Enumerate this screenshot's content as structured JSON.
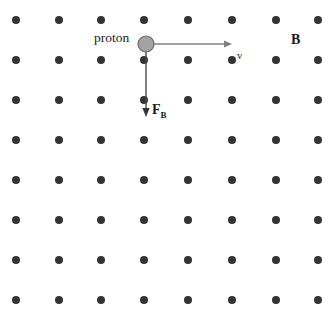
{
  "figure": {
    "width": 334,
    "height": 315,
    "background_color": "#ffffff"
  },
  "field": {
    "name": "magnetic-field-dot-grid",
    "symbol_meaning": "field-out-of-page",
    "dot_color": "#333333",
    "dot_radius": 4,
    "columns_x": [
      16,
      59,
      101,
      144,
      188,
      232,
      276,
      318
    ],
    "rows_y": [
      20,
      60,
      100,
      140,
      180,
      220,
      260,
      300
    ],
    "column_count": 8,
    "row_count": 8
  },
  "proton": {
    "label": "proton",
    "center_x": 146,
    "center_y": 44,
    "radius": 8,
    "fill_color": "#a3a3a3",
    "stroke_color": "#6b6b6b"
  },
  "velocity_vector": {
    "label": "v",
    "color": "#808080",
    "start_x": 154,
    "start_y": 44,
    "end_x": 232,
    "end_y": 44,
    "direction": "right",
    "label_x": 237,
    "label_y": 51
  },
  "force_vector": {
    "label": "F",
    "subscript": "B",
    "color": "#333333",
    "start_x": 146,
    "start_y": 50,
    "end_x": 146,
    "end_y": 117,
    "direction": "down",
    "label_x": 152,
    "label_y": 103
  },
  "field_label": {
    "label": "B",
    "color": "#1a1a1a",
    "label_x": 291,
    "label_y": 33
  }
}
